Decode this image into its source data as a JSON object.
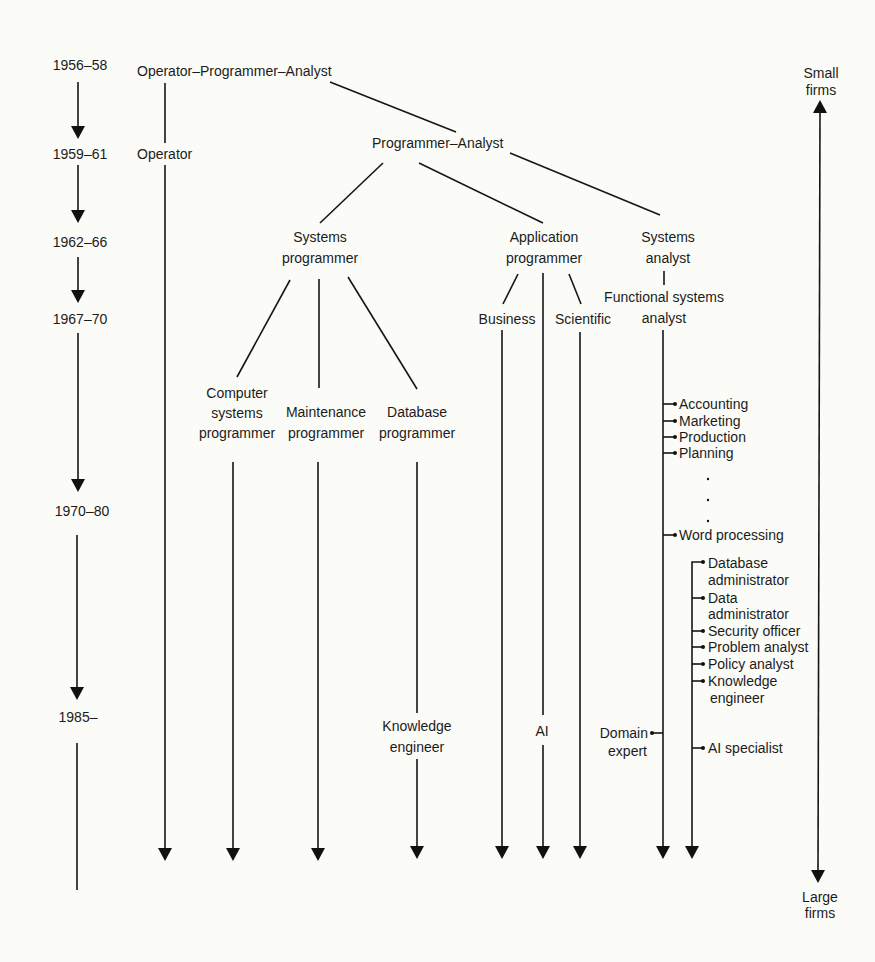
{
  "figure": {
    "timeline": {
      "periods": [
        "1956–58",
        "1959–61",
        "1962–66",
        "1967–70",
        "1970–80",
        "1985–"
      ]
    },
    "roles": {
      "operator_programmer_analyst": "Operator–Programmer–Analyst",
      "operator": "Operator",
      "programmer_analyst": "Programmer–Analyst",
      "systems_programmer": [
        "Systems",
        "programmer"
      ],
      "application_programmer": [
        "Application",
        "programmer"
      ],
      "systems_analyst": [
        "Systems",
        "analyst"
      ],
      "functional_systems_analyst": [
        "Functional systems",
        "analyst"
      ],
      "business": "Business",
      "scientific": "Scientific",
      "computer_systems_programmer": [
        "Computer",
        "systems",
        "programmer"
      ],
      "maintenance_programmer": [
        "Maintenance",
        "programmer"
      ],
      "database_programmer": [
        "Database",
        "programmer"
      ],
      "knowledge_engineer": [
        "Knowledge",
        "engineer"
      ],
      "ai": "AI",
      "domain_expert": [
        "Domain",
        "expert"
      ]
    },
    "functional_specializations": [
      "Accounting",
      "Marketing",
      "Production",
      "Planning",
      "Word processing"
    ],
    "specialist_roles": [
      [
        "Database",
        "administrator"
      ],
      [
        "Data",
        "administrator"
      ],
      [
        "Security officer"
      ],
      [
        "Problem analyst"
      ],
      [
        "Policy analyst"
      ],
      [
        "Knowledge",
        "engineer"
      ],
      [
        "AI specialist"
      ]
    ],
    "firm_size_axis": {
      "top": [
        "Small",
        "firms"
      ],
      "bottom": [
        "Large",
        "firms"
      ]
    }
  }
}
